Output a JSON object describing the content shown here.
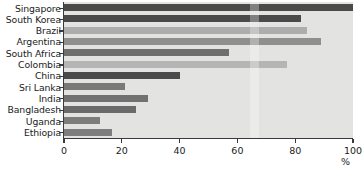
{
  "chart_data": {
    "type": "bar",
    "orientation": "horizontal",
    "title": "",
    "xlabel": "%",
    "ylabel": "",
    "xlim": [
      0,
      100
    ],
    "grid": false,
    "legend": null,
    "categories": [
      "Singapore",
      "South Korea",
      "Brazil",
      "Argentina",
      "South Africa",
      "Colombia",
      "China",
      "Sri Lanka",
      "India",
      "Bangladesh",
      "Uganda",
      "Ethiopia"
    ],
    "values": [
      100,
      82,
      84,
      89,
      57,
      77,
      40,
      21,
      29,
      25,
      12.5,
      16.5
    ],
    "bar_colors": [
      "#4a4a4a",
      "#4a4a4a",
      "#adadad",
      "#8f8f8f",
      "#6f6f6f",
      "#b5b5b5",
      "#4a4a4a",
      "#797979",
      "#717171",
      "#6b6b6b",
      "#7d7d7d",
      "#7d7d7d"
    ],
    "xticks": [
      0,
      20,
      40,
      60,
      80,
      100
    ],
    "xtick_labels": [
      "0",
      "20",
      "40",
      "60",
      "80",
      "100"
    ],
    "plot_background": "#e3e3e1",
    "axis_color": "#3a3a3a",
    "text_color": "#1b1b1b"
  }
}
